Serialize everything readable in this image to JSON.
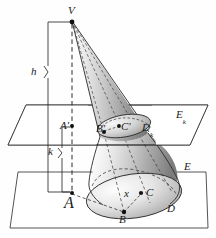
{
  "figure": {
    "kind": "geometry-diagram",
    "background_color": "#fefefe",
    "ink_color": "#1a1a1a",
    "shading": {
      "cone_light": "#f2f2f2",
      "cone_mid": "#b9b9b9",
      "cone_dark": "#6e6e6e",
      "base_fill": "#d8d8d8"
    }
  },
  "labels": {
    "apex": "V",
    "height_total": "h",
    "height_partial": "k",
    "plane_upper": "E",
    "plane_upper_sub": "k",
    "plane_lower": "E",
    "disk_upper": "D",
    "disk_upper_sub": "k",
    "disk_lower": "D",
    "foot_upper": "A",
    "foot_upper_prime": "′",
    "foot_lower": "A",
    "point_b_upper": "B",
    "point_b_upper_prime": "′",
    "point_c_upper": "C",
    "point_c_upper_prime": "′",
    "point_b_lower": "B",
    "point_c_lower": "C",
    "radius_lower": "x"
  },
  "points": {
    "V": {
      "x": 72,
      "y": 21
    },
    "A_prime": {
      "x": 72,
      "y": 126
    },
    "A": {
      "x": 72,
      "y": 194
    },
    "B_prime": {
      "x": 104,
      "y": 131
    },
    "C_prime": {
      "x": 120,
      "y": 126
    },
    "B": {
      "x": 124,
      "y": 212
    },
    "C": {
      "x": 141,
      "y": 194
    }
  },
  "geometry": {
    "plane_upper_polygon": "26,105 208,105 190,145 8,145",
    "plane_lower_polygon": "18,172 206,172 208,228 10,228",
    "axis_dashed": {
      "x": 72,
      "y_top": 21,
      "y_bottom": 194
    }
  }
}
